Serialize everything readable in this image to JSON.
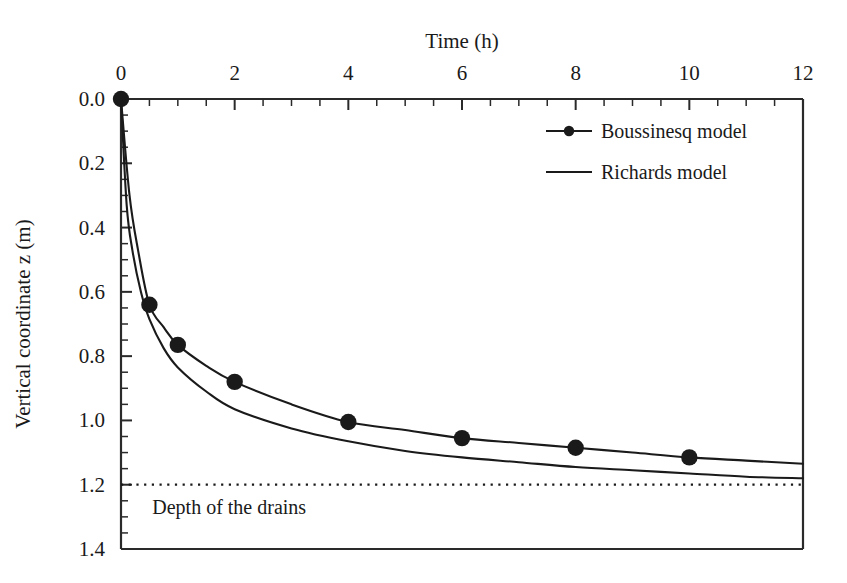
{
  "chart_data": {
    "type": "line",
    "title": "",
    "xlabel": "Time (h)",
    "ylabel": "Vertical coordinate z (m)",
    "xlim": [
      0,
      12
    ],
    "ylim": [
      0,
      1.4
    ],
    "y_inverted": true,
    "x_axis_position": "top",
    "grid": false,
    "xticks": [
      0,
      2,
      4,
      6,
      8,
      10,
      12
    ],
    "xtick_labels": [
      "0",
      "2",
      "4",
      "6",
      "8",
      "10",
      "12"
    ],
    "x_minor_tick_step": 0.5,
    "yticks": [
      0.0,
      0.2,
      0.4,
      0.6,
      0.8,
      1.0,
      1.2,
      1.4
    ],
    "ytick_labels": [
      "0.0",
      "0.2",
      "0.4",
      "0.6",
      "0.8",
      "1.0",
      "1.2",
      "1.4"
    ],
    "y_minor_tick_step": 0.05,
    "legend_position": "top-right",
    "series": [
      {
        "name": "Boussinesq model",
        "style": "line-with-markers",
        "marker": "filled-circle",
        "color": "#1a1a1a",
        "x": [
          0,
          0.15,
          0.3,
          0.5,
          0.75,
          1.0,
          1.5,
          2.0,
          3.0,
          4.0,
          5.0,
          6.0,
          7.0,
          8.0,
          9.0,
          10.0,
          11.0,
          12.0
        ],
        "y": [
          0.0,
          0.3,
          0.47,
          0.64,
          0.71,
          0.765,
          0.83,
          0.88,
          0.95,
          1.005,
          1.03,
          1.055,
          1.07,
          1.085,
          1.1,
          1.115,
          1.125,
          1.135
        ],
        "marker_points": [
          {
            "x": 0.0,
            "y": 0.0
          },
          {
            "x": 0.5,
            "y": 0.64
          },
          {
            "x": 1.0,
            "y": 0.765
          },
          {
            "x": 2.0,
            "y": 0.88
          },
          {
            "x": 4.0,
            "y": 1.005
          },
          {
            "x": 6.0,
            "y": 1.055
          },
          {
            "x": 8.0,
            "y": 1.085
          },
          {
            "x": 10.0,
            "y": 1.115
          }
        ]
      },
      {
        "name": "Richards model",
        "style": "line",
        "marker": "none",
        "color": "#1a1a1a",
        "x": [
          0,
          0.1,
          0.2,
          0.35,
          0.5,
          0.75,
          1.0,
          1.5,
          2.0,
          3.0,
          4.0,
          5.0,
          6.0,
          7.0,
          8.0,
          9.0,
          10.0,
          11.0,
          12.0
        ],
        "y": [
          0.0,
          0.33,
          0.47,
          0.6,
          0.685,
          0.775,
          0.835,
          0.91,
          0.965,
          1.025,
          1.065,
          1.095,
          1.115,
          1.13,
          1.145,
          1.155,
          1.165,
          1.175,
          1.18
        ]
      }
    ],
    "annotations": [
      {
        "name": "depth-of-drains",
        "label": "Depth of the drains",
        "type": "horizontal-line",
        "y": 1.2,
        "linestyle": "dotted",
        "color": "#1a1a1a",
        "label_x": 0.55,
        "label_y": 1.29
      }
    ]
  },
  "legend": {
    "entries": [
      {
        "label": "Boussinesq model",
        "marker": "filled-circle",
        "line": true
      },
      {
        "label": "Richards model",
        "marker": "none",
        "line": true
      }
    ]
  },
  "axes": {
    "top_axis_title": "Time (h)",
    "left_axis_title": "Vertical coordinate z (m)"
  }
}
